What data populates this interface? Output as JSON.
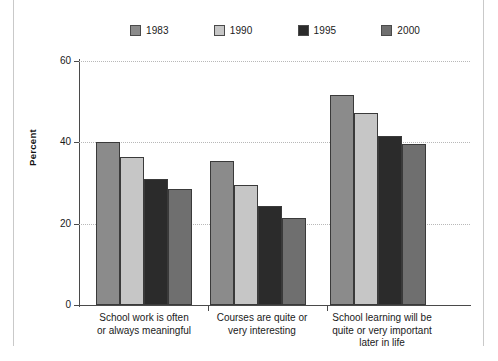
{
  "chart_data": {
    "type": "bar",
    "title": "",
    "xlabel": "",
    "ylabel": "Percent",
    "ylim": [
      0,
      60
    ],
    "yticks": [
      0,
      20,
      40,
      60
    ],
    "grid": true,
    "legend_position": "top",
    "categories": [
      "School work is often\nor always meaningful",
      "Courses are quite or\nvery interesting",
      "School learning will be\nquite or very important\nlater in life"
    ],
    "category_lines": [
      [
        "School work is often",
        "or always meaningful"
      ],
      [
        "Courses are quite or",
        "very interesting"
      ],
      [
        "School learning will be",
        "quite or very important",
        "later in life"
      ]
    ],
    "series": [
      {
        "name": "1983",
        "color": "#8b8b8b",
        "values": [
          40.2,
          35.4,
          51.6
        ]
      },
      {
        "name": "1990",
        "color": "#c6c6c6",
        "values": [
          36.5,
          29.4,
          47.2
        ]
      },
      {
        "name": "1995",
        "color": "#2b2b2b",
        "values": [
          31.1,
          24.4,
          41.5
        ]
      },
      {
        "name": "2000",
        "color": "#6f6f6f",
        "values": [
          28.5,
          21.4,
          39.5
        ]
      }
    ]
  },
  "axis": {
    "y_tick_labels": [
      "0",
      "20",
      "40",
      "60"
    ],
    "y_axis_title": "Percent"
  },
  "legend": {
    "entries": [
      {
        "label": "1983",
        "color": "#8b8b8b"
      },
      {
        "label": "1990",
        "color": "#c6c6c6"
      },
      {
        "label": "1995",
        "color": "#2b2b2b"
      },
      {
        "label": "2000",
        "color": "#6f6f6f"
      }
    ]
  }
}
